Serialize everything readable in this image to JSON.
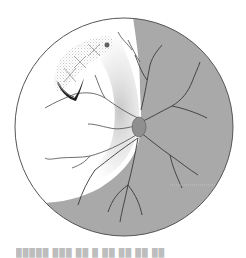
{
  "figure": {
    "type": "fundus-illustration",
    "colors": {
      "background": "#ffffff",
      "fundus_outline": "#555555",
      "shaded_region": "#a9a9a9",
      "vessel": "#3a3a3a",
      "stipple": "#8a8a8a",
      "tear": "#1e1e1e",
      "lesion_hatch": "#cfcfcf"
    },
    "elements": {
      "optic_disc": "optic-disc",
      "tear": "horseshoe-tear",
      "lesions": [
        "lattice-lesion-1",
        "lattice-lesion-2",
        "lattice-lesion-3"
      ],
      "dot": "pigment-dot"
    }
  },
  "caption": {
    "text": "█████  ███  ██ █  ██ ██  ██ ██"
  }
}
